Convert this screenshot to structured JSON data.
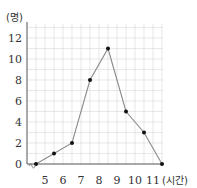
{
  "chart_data": {
    "type": "line",
    "title": "",
    "xlabel": "(시간)",
    "ylabel": "(명)",
    "x_ticks": [
      5,
      6,
      7,
      8,
      9,
      10,
      11
    ],
    "y_ticks": [
      0,
      2,
      4,
      6,
      8,
      10,
      12
    ],
    "xlim": [
      4.5,
      11.5
    ],
    "ylim": [
      0,
      13
    ],
    "grid": true,
    "axis_break_x": true,
    "series": [
      {
        "name": "frequency polygon",
        "x": [
          4.5,
          5.5,
          6.5,
          7.5,
          8.5,
          9.5,
          10.5,
          11.5
        ],
        "values": [
          0,
          1,
          2,
          8,
          11,
          5,
          3,
          0
        ]
      }
    ],
    "colors": {
      "line": "#8a8a8a",
      "marker": "#111111",
      "grid": "#d9d9d9",
      "axis": "#555555"
    }
  },
  "labels": {
    "y_unit": "(명)",
    "x_unit": "(시간)"
  }
}
